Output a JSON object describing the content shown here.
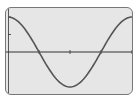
{
  "chart_data": {
    "type": "line",
    "title": "",
    "xlabel": "",
    "ylabel": "",
    "function": "y = cos(x)",
    "xlim": [
      0,
      6.2832
    ],
    "ylim": [
      -1.2,
      1.2
    ],
    "x_ticks": [
      1.5708,
      3.1416,
      4.7124,
      6.2832
    ],
    "y_ticks": [
      0.5,
      1.0
    ],
    "grid": false,
    "series": [
      {
        "name": "curve",
        "x": [
          0,
          0.5236,
          1.0472,
          1.5708,
          2.0944,
          2.618,
          3.1416,
          3.6652,
          4.1888,
          4.7124,
          5.236,
          5.7596,
          6.2832
        ],
        "y": [
          1,
          0.866,
          0.5,
          0,
          -0.5,
          -0.866,
          -1,
          -0.866,
          -0.5,
          0,
          0.5,
          0.866,
          1
        ]
      }
    ],
    "colors": {
      "curve": "#555555",
      "axis": "#333333",
      "background": "#e6e6e6"
    }
  }
}
